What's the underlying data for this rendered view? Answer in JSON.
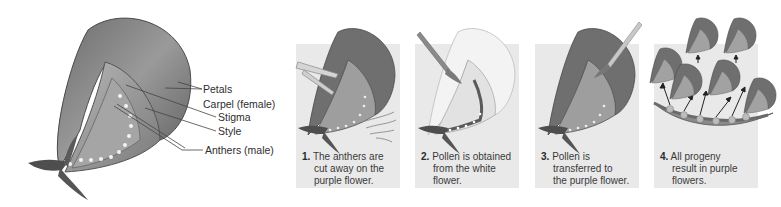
{
  "diagram": {
    "type": "mendel-cross-pollination",
    "color_scheme": "grayscale"
  },
  "flower_anatomy": {
    "labels": [
      {
        "id": "petals",
        "text": "Petals"
      },
      {
        "id": "carpel",
        "text": "Carpel (female)"
      },
      {
        "id": "stigma",
        "text": "Stigma"
      },
      {
        "id": "style",
        "text": "Style"
      },
      {
        "id": "anthers",
        "text": "Anthers (male)"
      }
    ]
  },
  "steps": [
    {
      "number": "1.",
      "lines": [
        "The anthers are",
        "cut away on the",
        "purple flower."
      ]
    },
    {
      "number": "2.",
      "lines": [
        "Pollen is obtained",
        "from the white",
        "flower."
      ]
    },
    {
      "number": "3.",
      "lines": [
        "Pollen is",
        "transferred to",
        "the purple flower."
      ]
    },
    {
      "number": "4.",
      "lines": [
        "All progeny",
        "result in purple",
        "flowers."
      ]
    }
  ],
  "colors": {
    "panel_bg": "#e9e9e9",
    "flower_dark": "#5a5a5a",
    "flower_mid": "#8a8a8a",
    "flower_light": "#bdbdbd",
    "white_flower": "#f2f2f2",
    "text": "#333333"
  }
}
